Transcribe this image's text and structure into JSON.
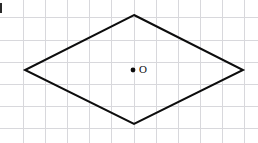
{
  "figure": {
    "canvas": {
      "width": 258,
      "height": 143,
      "background": "#ffffff"
    },
    "grid": {
      "visible": true,
      "color": "#d8d8dc",
      "spacing": 22,
      "x_lines": [
        23,
        45,
        67,
        89,
        111,
        134,
        156,
        178,
        200,
        222,
        244
      ],
      "y_lines": [
        17,
        40,
        62,
        84,
        106,
        128
      ]
    },
    "shape": {
      "name": "rhombus",
      "stroke_color": "#0d0d0d",
      "stroke_width": 2,
      "fill": "none",
      "points": "134,15 243,70 134,124 25,70",
      "vertices": [
        {
          "name": "top",
          "x": 134,
          "y": 15
        },
        {
          "name": "right",
          "x": 243,
          "y": 70
        },
        {
          "name": "bottom",
          "x": 134,
          "y": 124
        },
        {
          "name": "left",
          "x": 25,
          "y": 70
        }
      ]
    },
    "center": {
      "label": "O",
      "x": 133,
      "y": 70,
      "dot_radius": 2.4,
      "label_x": 139,
      "label_y": 70,
      "color": "#0d0d0d"
    },
    "artifact": {
      "description": "cut-off mark at left edge",
      "color": "#2a2a2a"
    }
  }
}
